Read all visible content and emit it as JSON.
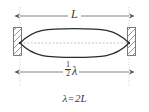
{
  "figure": {
    "background_color": "#ffffff",
    "ink_color": "#3a3a3a",
    "wave_color": "#2b2b2b",
    "guide_color": "#b9b9b9",
    "wall_color": "#8f8f8f"
  },
  "labels": {
    "length_label": "L",
    "half_wavelength": {
      "numerator": "1",
      "denominator": "2",
      "symbol": "λ"
    },
    "equation": {
      "lhs": "λ",
      "operator": "=",
      "rhs": "2L"
    }
  },
  "geometry": {
    "left_wall_x": 20,
    "right_wall_x": 129,
    "axis_y": 43,
    "top_dimension_y": 16,
    "bottom_dimension_y": 72,
    "antinode_amplitude": 14
  },
  "elements": {
    "left_wall_name": "left-fixed-end-wall",
    "right_wall_name": "right-fixed-end-wall",
    "wave_name": "standing-wave-envelope",
    "axis_name": "equilibrium-axis",
    "top_dim_name": "length-dimension-line",
    "bottom_dim_name": "half-wavelength-dimension-line"
  }
}
